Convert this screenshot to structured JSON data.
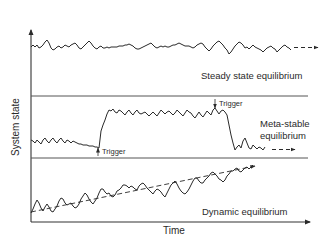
{
  "diagram": {
    "axes": {
      "x_label": "Time",
      "y_label": "System state"
    },
    "panels": [
      {
        "id": "steady",
        "label": "Steady state equilibrium",
        "description": "Flat noisy signal around a constant level, continuing (dashed arrow)"
      },
      {
        "id": "meta",
        "label_line1": "Meta-stable",
        "label_line2": "equilibrium",
        "triggers": [
          {
            "label": "Trigger",
            "direction": "up",
            "effect": "jump to higher level"
          },
          {
            "label": "Trigger",
            "direction": "down",
            "effect": "drop to lower level"
          }
        ],
        "description": "Low level, trigger causes jump to high plateau, second trigger returns to low level"
      },
      {
        "id": "dynamic",
        "label": "Dynamic equilibrium",
        "description": "Noisy signal fluctuating around a rising dashed trend line"
      }
    ],
    "colors": {
      "line": "#2a2a2a",
      "axis": "#333333",
      "background": "#ffffff"
    }
  }
}
